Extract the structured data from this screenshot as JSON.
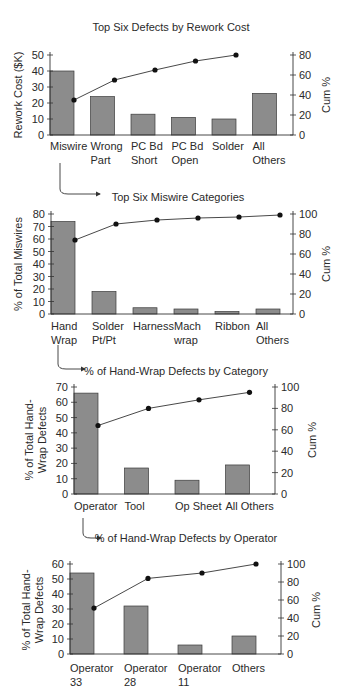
{
  "chart_data": [
    {
      "type": "bar",
      "title": "Top Six Defects by Rework Cost",
      "xlabel": "",
      "ylabel": "Rework Cost ($K)",
      "y2label": "Cum %",
      "ylim": [
        0,
        50
      ],
      "y2lim": [
        0,
        80
      ],
      "yticks": [
        0,
        10,
        20,
        30,
        40,
        50
      ],
      "y2ticks": [
        0,
        20,
        40,
        60,
        80
      ],
      "categories": [
        "Miswire",
        "Wrong Part",
        "PC Bd Short",
        "PC Bd Open",
        "Solder",
        "All Others"
      ],
      "category_lines": [
        [
          "Miswire"
        ],
        [
          "Wrong",
          "Part"
        ],
        [
          "PC Bd",
          "Short"
        ],
        [
          "PC Bd",
          "Open"
        ],
        [
          "Solder"
        ],
        [
          "All",
          "Others"
        ]
      ],
      "series": [
        {
          "name": "Rework Cost ($K)",
          "type": "bar",
          "values": [
            40,
            24,
            13,
            11,
            10,
            26
          ]
        },
        {
          "name": "Cum %",
          "type": "line",
          "axis": "right",
          "values": [
            35,
            55,
            65,
            74,
            80
          ]
        }
      ],
      "grid": false
    },
    {
      "type": "bar",
      "title": "Top Six Miswire Categories",
      "xlabel": "",
      "ylabel": "% of Total Miswires",
      "y2label": "Cum %",
      "ylim": [
        0,
        80
      ],
      "y2lim": [
        0,
        100
      ],
      "yticks": [
        0,
        10,
        20,
        30,
        40,
        50,
        60,
        70,
        80
      ],
      "y2ticks": [
        0,
        20,
        40,
        60,
        80,
        100
      ],
      "categories": [
        "Hand Wrap",
        "Solder Pt/Pt",
        "Harness",
        "Mach wrap",
        "Ribbon",
        "All Others"
      ],
      "category_lines": [
        [
          "Hand",
          "Wrap"
        ],
        [
          "Solder",
          "Pt/Pt"
        ],
        [
          "Harness"
        ],
        [
          "Mach",
          "wrap"
        ],
        [
          "Ribbon"
        ],
        [
          "All",
          "Others"
        ]
      ],
      "series": [
        {
          "name": "% of Total Miswires",
          "type": "bar",
          "values": [
            74,
            18,
            5,
            4,
            2,
            4
          ]
        },
        {
          "name": "Cum %",
          "type": "line",
          "axis": "right",
          "values": [
            74,
            90,
            94,
            96,
            97,
            99
          ]
        }
      ],
      "grid": false
    },
    {
      "type": "bar",
      "title": "% of Hand-Wrap Defects by Category",
      "xlabel": "",
      "ylabel": "% of Total Hand-Wrap Defects",
      "ylabel_lines": [
        "% of Total Hand-",
        "Wrap Defects"
      ],
      "y2label": "Cum %",
      "ylim": [
        0,
        70
      ],
      "y2lim": [
        0,
        100
      ],
      "yticks": [
        0,
        10,
        20,
        30,
        40,
        50,
        60,
        70
      ],
      "y2ticks": [
        0,
        20,
        40,
        60,
        80,
        100
      ],
      "categories": [
        "Operator",
        "Tool",
        "Op Sheet",
        "All Others"
      ],
      "category_lines": [
        [
          "Operator"
        ],
        [
          "Tool"
        ],
        [
          "Op Sheet"
        ],
        [
          "All Others"
        ]
      ],
      "series": [
        {
          "name": "% of Total Hand-Wrap Defects",
          "type": "bar",
          "values": [
            66,
            17,
            9,
            19
          ]
        },
        {
          "name": "Cum %",
          "type": "line",
          "axis": "right",
          "values": [
            64,
            80,
            88,
            95
          ]
        }
      ],
      "grid": false
    },
    {
      "type": "bar",
      "title": "% of Hand-Wrap Defects by Operator",
      "xlabel": "",
      "ylabel": "% of Total Hand-Wrap Defects",
      "ylabel_lines": [
        "% of Total Hand-",
        "Wrap Defects"
      ],
      "y2label": "Cum %",
      "ylim": [
        0,
        60
      ],
      "y2lim": [
        0,
        100
      ],
      "yticks": [
        0,
        10,
        20,
        30,
        40,
        50,
        60
      ],
      "y2ticks": [
        0,
        20,
        40,
        60,
        80,
        100
      ],
      "categories": [
        "Operator 33",
        "Operator 28",
        "Operator 11",
        "Others"
      ],
      "category_lines": [
        [
          "Operator",
          "33"
        ],
        [
          "Operator",
          "28"
        ],
        [
          "Operator",
          "11"
        ],
        [
          "Others"
        ]
      ],
      "series": [
        {
          "name": "% of Total Hand-Wrap Defects",
          "type": "bar",
          "values": [
            54,
            32,
            6,
            12
          ]
        },
        {
          "name": "Cum %",
          "type": "line",
          "axis": "right",
          "values": [
            51,
            84,
            90,
            100
          ]
        }
      ],
      "grid": false
    }
  ],
  "colors": {
    "bar_fill": "#8c8c8c",
    "bar_stroke": "#3a3a3a",
    "axis": "#333333",
    "line": "#333333",
    "marker": "#111111"
  }
}
